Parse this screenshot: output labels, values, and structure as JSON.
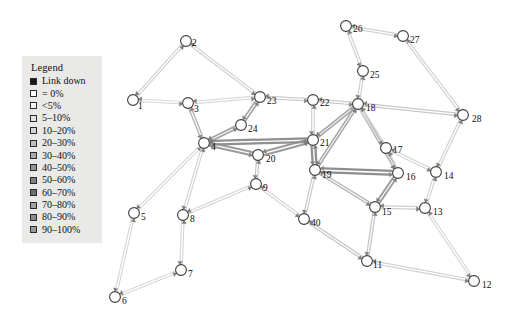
{
  "figure": {
    "kind": "network-topology-diagram",
    "background": "#ffffff",
    "width": 520,
    "height": 318
  },
  "legend": {
    "title": "Legend",
    "position": {
      "x": 22,
      "y": 56,
      "width": 80,
      "height": 180
    },
    "background": "#e9e9e7",
    "entries": [
      {
        "label": "Link down",
        "color": "#1a1a1a",
        "swatch": "filled-black"
      },
      {
        "label": "= 0%",
        "color": "#ffffff"
      },
      {
        "label": "<5%",
        "color": "#f2f2f2"
      },
      {
        "label": "5–10%",
        "color": "#e2e2e2"
      },
      {
        "label": "10–20%",
        "color": "#d2d2d2"
      },
      {
        "label": "20–30%",
        "color": "#bdbdbd"
      },
      {
        "label": "30–40%",
        "color": "#a8a8a8"
      },
      {
        "label": "40–50%",
        "color": "#949494"
      },
      {
        "label": "50–60%",
        "color": "#7f7f7f"
      },
      {
        "label": "60–70%",
        "color": "#6b6b6b"
      },
      {
        "label": "70–80%",
        "color": "#a0a0a0"
      },
      {
        "label": "80–90%",
        "color": "#8c8c8c"
      },
      {
        "label": "90–100%",
        "color": "#9a9a9a"
      }
    ]
  },
  "chart_data": {
    "type": "graph",
    "title": "",
    "node_count": 28,
    "link_count": 36,
    "nodes": [
      {
        "id": "1",
        "x": 133,
        "y": 100,
        "label_dx": 5,
        "label_dy": 7
      },
      {
        "id": "2",
        "x": 186,
        "y": 41,
        "label_dx": 6,
        "label_dy": 3
      },
      {
        "id": "3",
        "x": 188,
        "y": 103,
        "label_dx": 6,
        "label_dy": 7
      },
      {
        "id": "4",
        "x": 204,
        "y": 143,
        "label_dx": 7,
        "label_dy": 5
      },
      {
        "id": "5",
        "x": 134,
        "y": 213,
        "label_dx": 7,
        "label_dy": 5
      },
      {
        "id": "6",
        "x": 115,
        "y": 297,
        "label_dx": 7,
        "label_dy": 5
      },
      {
        "id": "7",
        "x": 181,
        "y": 270,
        "label_dx": 7,
        "label_dy": 5
      },
      {
        "id": "8",
        "x": 183,
        "y": 215,
        "label_dx": 7,
        "label_dy": 5
      },
      {
        "id": "9",
        "x": 256,
        "y": 184,
        "label_dx": 7,
        "label_dy": 5
      },
      {
        "id": "40",
        "x": 304,
        "y": 219,
        "label_dx": 7,
        "label_dy": 5
      },
      {
        "id": "11",
        "x": 367,
        "y": 261,
        "label_dx": 6,
        "label_dy": 5
      },
      {
        "id": "12",
        "x": 474,
        "y": 281,
        "label_dx": 8,
        "label_dy": 5
      },
      {
        "id": "13",
        "x": 425,
        "y": 208,
        "label_dx": 8,
        "label_dy": 5
      },
      {
        "id": "14",
        "x": 436,
        "y": 172,
        "label_dx": 8,
        "label_dy": 5
      },
      {
        "id": "15",
        "x": 375,
        "y": 207,
        "label_dx": 7,
        "label_dy": 6
      },
      {
        "id": "16",
        "x": 398,
        "y": 173,
        "label_dx": 8,
        "label_dy": 5
      },
      {
        "id": "17",
        "x": 386,
        "y": 148,
        "label_dx": 7,
        "label_dy": 3
      },
      {
        "id": "18",
        "x": 358,
        "y": 104,
        "label_dx": 8,
        "label_dy": 5
      },
      {
        "id": "19",
        "x": 315,
        "y": 170,
        "label_dx": 7,
        "label_dy": 6
      },
      {
        "id": "20",
        "x": 258,
        "y": 155,
        "label_dx": 8,
        "label_dy": 5
      },
      {
        "id": "21",
        "x": 313,
        "y": 140,
        "label_dx": 7,
        "label_dy": 4
      },
      {
        "id": "22",
        "x": 313,
        "y": 100,
        "label_dx": 7,
        "label_dy": 4
      },
      {
        "id": "23",
        "x": 260,
        "y": 97,
        "label_dx": 7,
        "label_dy": 5
      },
      {
        "id": "24",
        "x": 241,
        "y": 125,
        "label_dx": 7,
        "label_dy": 5
      },
      {
        "id": "25",
        "x": 363,
        "y": 71,
        "label_dx": 7,
        "label_dy": 5
      },
      {
        "id": "26",
        "x": 346,
        "y": 26,
        "label_dx": 7,
        "label_dy": 4
      },
      {
        "id": "27",
        "x": 403,
        "y": 36,
        "label_dx": 7,
        "label_dy": 5
      },
      {
        "id": "28",
        "x": 463,
        "y": 115,
        "label_dx": 9,
        "label_dy": 5
      }
    ],
    "links": [
      {
        "source": "1",
        "target": "2",
        "utilization": "5-10%",
        "color": "#dadada",
        "width": 2.2
      },
      {
        "source": "2",
        "target": "23",
        "utilization": "5-10%",
        "color": "#dadada",
        "width": 2.2
      },
      {
        "source": "1",
        "target": "3",
        "utilization": "<5%",
        "color": "#e6e6e6",
        "width": 2.0
      },
      {
        "source": "3",
        "target": "23",
        "utilization": "<5%",
        "color": "#e4e4e4",
        "width": 2.0
      },
      {
        "source": "3",
        "target": "4",
        "utilization": "20-30%",
        "color": "#b9b9b9",
        "width": 2.6
      },
      {
        "source": "4",
        "target": "24",
        "utilization": "30-40%",
        "color": "#a9a9a9",
        "width": 3.4
      },
      {
        "source": "24",
        "target": "23",
        "utilization": "30-40%",
        "color": "#a9a9a9",
        "width": 3.4
      },
      {
        "source": "23",
        "target": "22",
        "utilization": "10-20%",
        "color": "#cfcfcf",
        "width": 2.2
      },
      {
        "source": "22",
        "target": "18",
        "utilization": "10-20%",
        "color": "#cdcdcd",
        "width": 2.2
      },
      {
        "source": "22",
        "target": "21",
        "utilization": "<5%",
        "color": "#d8d8d8",
        "width": 1.8
      },
      {
        "source": "4",
        "target": "20",
        "utilization": "40-50%",
        "color": "#9c9c9c",
        "width": 4.0
      },
      {
        "source": "20",
        "target": "21",
        "utilization": "40-50%",
        "color": "#9c9c9c",
        "width": 4.0
      },
      {
        "source": "4",
        "target": "21",
        "utilization": "50-60%",
        "color": "#8f8f8f",
        "width": 4.4
      },
      {
        "source": "21",
        "target": "19",
        "utilization": "50-60%",
        "color": "#8f8f8f",
        "width": 4.4
      },
      {
        "source": "21",
        "target": "18",
        "utilization": "30-40%",
        "color": "#a9a9a9",
        "width": 3.0
      },
      {
        "source": "19",
        "target": "18",
        "utilization": "30-40%",
        "color": "#aaaaaa",
        "width": 3.0
      },
      {
        "source": "19",
        "target": "16",
        "utilization": "50-60%",
        "color": "#8d8d8d",
        "width": 4.4
      },
      {
        "source": "16",
        "target": "15",
        "utilization": "40-50%",
        "color": "#9e9e9e",
        "width": 3.6
      },
      {
        "source": "19",
        "target": "15",
        "utilization": "20-30%",
        "color": "#bcbcbc",
        "width": 2.6
      },
      {
        "source": "18",
        "target": "16",
        "utilization": "20-30%",
        "color": "#bababa",
        "width": 2.6
      },
      {
        "source": "18",
        "target": "17",
        "utilization": "<5%",
        "color": "#dcdcdc",
        "width": 2.0
      },
      {
        "source": "17",
        "target": "16",
        "utilization": "<5%",
        "color": "#dedede",
        "width": 1.8
      },
      {
        "source": "17",
        "target": "14",
        "utilization": "<5%",
        "color": "#dedede",
        "width": 1.8
      },
      {
        "source": "14",
        "target": "13",
        "utilization": "<5%",
        "color": "#e0e0e0",
        "width": 1.8
      },
      {
        "source": "13",
        "target": "15",
        "utilization": "5-10%",
        "color": "#dadada",
        "width": 2.2
      },
      {
        "source": "18",
        "target": "28",
        "utilization": "10-20%",
        "color": "#d2d2d2",
        "width": 2.4
      },
      {
        "source": "28",
        "target": "14",
        "utilization": "5-10%",
        "color": "#dcdcdc",
        "width": 2.2
      },
      {
        "source": "27",
        "target": "28",
        "utilization": "5-10%",
        "color": "#dcdcdc",
        "width": 2.2
      },
      {
        "source": "26",
        "target": "27",
        "utilization": "5-10%",
        "color": "#dadada",
        "width": 2.2
      },
      {
        "source": "26",
        "target": "25",
        "utilization": "5-10%",
        "color": "#dadada",
        "width": 2.2
      },
      {
        "source": "25",
        "target": "18",
        "utilization": "5-10%",
        "color": "#dadada",
        "width": 2.2
      },
      {
        "source": "4",
        "target": "5",
        "utilization": "<5%",
        "color": "#e2e2e2",
        "width": 2.0
      },
      {
        "source": "5",
        "target": "6",
        "utilization": "<5%",
        "color": "#e4e4e4",
        "width": 2.0
      },
      {
        "source": "6",
        "target": "7",
        "utilization": "<5%",
        "color": "#e4e4e4",
        "width": 2.0
      },
      {
        "source": "7",
        "target": "8",
        "utilization": "<5%",
        "color": "#e2e2e2",
        "width": 2.0
      },
      {
        "source": "4",
        "target": "8",
        "utilization": "<5%",
        "color": "#e0e0e0",
        "width": 2.0
      },
      {
        "source": "8",
        "target": "9",
        "utilization": "<5%",
        "color": "#e0e0e0",
        "width": 2.0
      },
      {
        "source": "20",
        "target": "9",
        "utilization": "10-20%",
        "color": "#d0d0d0",
        "width": 2.2
      },
      {
        "source": "9",
        "target": "40",
        "utilization": "<5%",
        "color": "#e2e2e2",
        "width": 2.0
      },
      {
        "source": "19",
        "target": "40",
        "utilization": "10-20%",
        "color": "#d2d2d2",
        "width": 2.2
      },
      {
        "source": "40",
        "target": "11",
        "utilization": "10-20%",
        "color": "#cecece",
        "width": 2.4
      },
      {
        "source": "15",
        "target": "11",
        "utilization": "10-20%",
        "color": "#d0d0d0",
        "width": 2.4
      },
      {
        "source": "11",
        "target": "12",
        "utilization": "5-10%",
        "color": "#dcdcdc",
        "width": 2.2
      },
      {
        "source": "13",
        "target": "12",
        "utilization": "<5%",
        "color": "#e2e2e2",
        "width": 2.0
      }
    ]
  }
}
